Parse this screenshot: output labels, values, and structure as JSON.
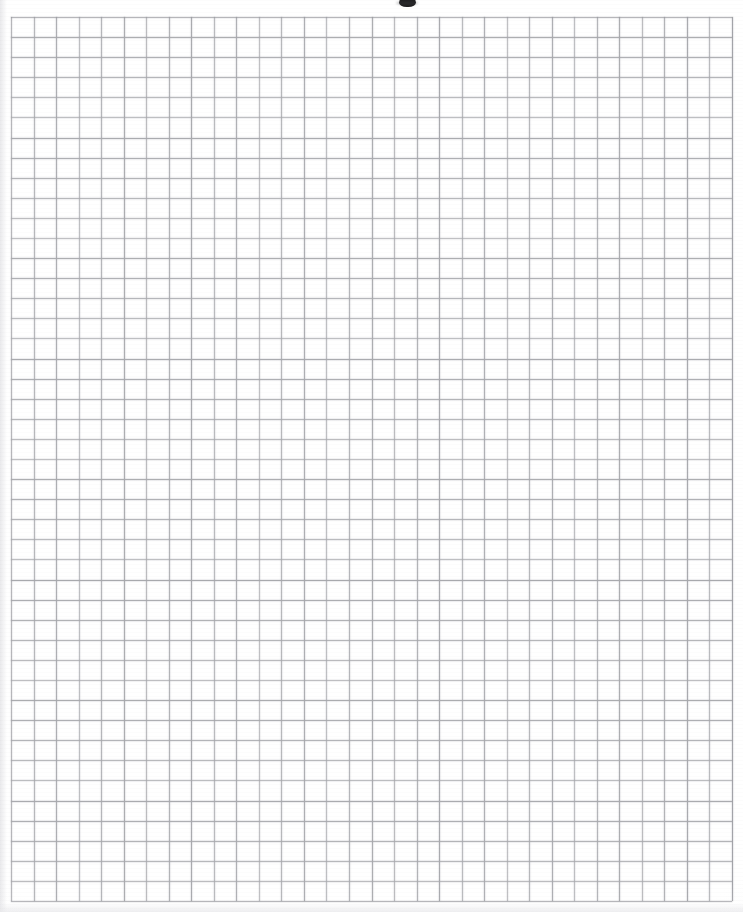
{
  "page": {
    "width": 743,
    "height": 912,
    "background_color": "#ffffff",
    "document_type": "scanned graph paper sheet",
    "visible_text": ""
  },
  "grid": {
    "name": "quadrille-grid",
    "origin_x": 11,
    "origin_y": 17,
    "width": 721,
    "height": 884,
    "columns": 32,
    "rows": 44,
    "cell_width": 22.5,
    "cell_height": 20.1,
    "line_color": "#a8a9ad",
    "edge_line_color": "#9a9ba0",
    "line_width": 1,
    "fill_color": "#ffffff",
    "labels": [],
    "tick_labels": [],
    "annotations": []
  },
  "artifacts": {
    "top_smudge": {
      "name": "ink-smudge",
      "x": 399,
      "y": -4,
      "width": 17,
      "height": 11,
      "color": "#1d1d1f"
    }
  },
  "chart_data": {
    "type": "table",
    "title": "",
    "subtitle": "",
    "xlabel": "",
    "ylabel": "",
    "grid": true,
    "legend_position": "none",
    "categories": [],
    "values": [],
    "series": [],
    "note": "Blank graph paper: a 32 x 44 empty quadrille grid with no plotted data, no axis tick labels, and no legend."
  }
}
